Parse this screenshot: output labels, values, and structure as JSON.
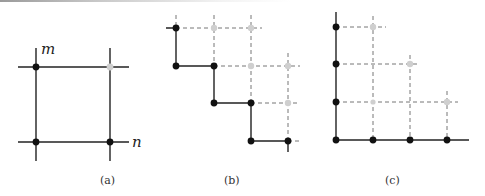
{
  "figure": {
    "panels": [
      {
        "id": "a",
        "caption": "(a)",
        "axis_labels": {
          "vertical": "m",
          "horizontal": "n"
        },
        "description": "Unit square grid cell with three black lattice points and one grey lattice point at top-right"
      },
      {
        "id": "b",
        "caption": "(b)",
        "description": "Staircase path of black lattice points with dashed grid extensions and grey points"
      },
      {
        "id": "c",
        "caption": "(c)",
        "description": "L-shaped axes with black lattice points along both axes and grey points on a dashed triangular grid"
      }
    ],
    "colors": {
      "solid_line": "#222222",
      "dashed_line": "#777777",
      "black_point": "#111111",
      "grey_point": "#cfcfcf"
    }
  }
}
